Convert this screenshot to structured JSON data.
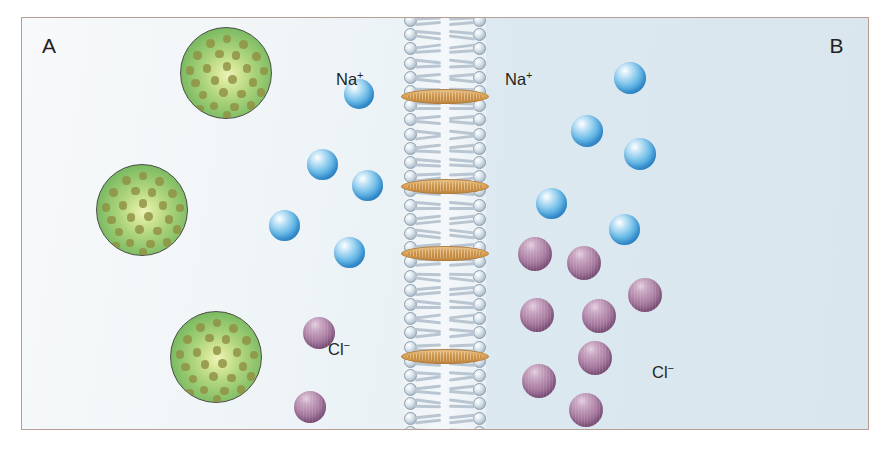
{
  "figure": {
    "compartment_a_label": "A",
    "compartment_b_label": "B",
    "background_left": "#f3f7f8",
    "background_right": "#dce8f0",
    "border_color": "#b79d94"
  },
  "labels": {
    "na_left": "Na",
    "na_left_charge": "+",
    "na_right": "Na",
    "na_right_charge": "+",
    "cl_left": "Cl",
    "cl_left_charge": "−",
    "cl_right": "Cl",
    "cl_right_charge": "−"
  },
  "legend": {
    "protein_color": "#7cbb63",
    "protein_dot_color": "#8f9042",
    "sodium_color": "#3d9ddc",
    "chloride_color": "#92638c",
    "channel_color": "#dca85e",
    "lipid_head_color": "#aebecd",
    "lipid_tail_color": "#b9c6d2"
  },
  "chart_data": {
    "type": "diagram",
    "compartments": [
      {
        "name": "A",
        "side": "left",
        "sodium_count": 5,
        "chloride_count": 2,
        "protein_count": 3
      },
      {
        "name": "B",
        "side": "right",
        "sodium_count": 5,
        "chloride_count": 9,
        "protein_count": 0
      }
    ],
    "membrane": {
      "type": "phospholipid-bilayer",
      "channel_protein_count": 4,
      "channel_positions_y": [
        88,
        178,
        245,
        348
      ]
    },
    "species": [
      {
        "name": "Na+",
        "color": "#3d9ddc",
        "total": 10
      },
      {
        "name": "Cl-",
        "color": "#92638c",
        "total": 11
      },
      {
        "name": "protein",
        "color": "#7cbb63",
        "total": 3
      }
    ]
  },
  "proteins": [
    {
      "x": 158,
      "y": 9,
      "d": 92
    },
    {
      "x": 74,
      "y": 146,
      "d": 92
    },
    {
      "x": 148,
      "y": 293,
      "d": 92
    }
  ],
  "protein_dots": [
    {
      "cx": 0.5,
      "cy": 0.12
    },
    {
      "cx": 0.32,
      "cy": 0.17
    },
    {
      "cx": 0.68,
      "cy": 0.18
    },
    {
      "cx": 0.18,
      "cy": 0.3
    },
    {
      "cx": 0.42,
      "cy": 0.28
    },
    {
      "cx": 0.6,
      "cy": 0.3
    },
    {
      "cx": 0.82,
      "cy": 0.31
    },
    {
      "cx": 0.1,
      "cy": 0.46
    },
    {
      "cx": 0.28,
      "cy": 0.44
    },
    {
      "cx": 0.5,
      "cy": 0.42
    },
    {
      "cx": 0.72,
      "cy": 0.44
    },
    {
      "cx": 0.9,
      "cy": 0.47
    },
    {
      "cx": 0.16,
      "cy": 0.6
    },
    {
      "cx": 0.37,
      "cy": 0.57
    },
    {
      "cx": 0.56,
      "cy": 0.56
    },
    {
      "cx": 0.78,
      "cy": 0.59
    },
    {
      "cx": 0.24,
      "cy": 0.73
    },
    {
      "cx": 0.46,
      "cy": 0.7
    },
    {
      "cx": 0.66,
      "cy": 0.72
    },
    {
      "cx": 0.87,
      "cy": 0.7
    },
    {
      "cx": 0.36,
      "cy": 0.85
    },
    {
      "cx": 0.58,
      "cy": 0.86
    },
    {
      "cx": 0.76,
      "cy": 0.84
    },
    {
      "cx": 0.5,
      "cy": 0.95
    },
    {
      "cx": 0.2,
      "cy": 0.88
    }
  ],
  "sodium_ions": [
    {
      "x": 322,
      "y": 61,
      "d": 30,
      "side": "A"
    },
    {
      "x": 285,
      "y": 131,
      "d": 31,
      "side": "A"
    },
    {
      "x": 330,
      "y": 152,
      "d": 31,
      "side": "A"
    },
    {
      "x": 247,
      "y": 192,
      "d": 31,
      "side": "A"
    },
    {
      "x": 312,
      "y": 219,
      "d": 31,
      "side": "A"
    },
    {
      "x": 592,
      "y": 44,
      "d": 32,
      "side": "B"
    },
    {
      "x": 549,
      "y": 97,
      "d": 32,
      "side": "B"
    },
    {
      "x": 602,
      "y": 120,
      "d": 32,
      "side": "B"
    },
    {
      "x": 514,
      "y": 170,
      "d": 31,
      "side": "B"
    },
    {
      "x": 587,
      "y": 196,
      "d": 31,
      "side": "B"
    }
  ],
  "chloride_ions": [
    {
      "x": 281,
      "y": 299,
      "d": 32,
      "side": "A"
    },
    {
      "x": 272,
      "y": 373,
      "d": 32,
      "side": "A"
    },
    {
      "x": 496,
      "y": 219,
      "d": 34,
      "side": "B"
    },
    {
      "x": 545,
      "y": 228,
      "d": 34,
      "side": "B"
    },
    {
      "x": 606,
      "y": 260,
      "d": 34,
      "side": "B"
    },
    {
      "x": 498,
      "y": 280,
      "d": 34,
      "side": "B"
    },
    {
      "x": 560,
      "y": 281,
      "d": 34,
      "side": "B"
    },
    {
      "x": 556,
      "y": 323,
      "d": 34,
      "side": "B"
    },
    {
      "x": 500,
      "y": 346,
      "d": 34,
      "side": "B"
    },
    {
      "x": 547,
      "y": 375,
      "d": 34,
      "side": "B"
    },
    {
      "x": 611,
      "y": 258,
      "d": 0,
      "side": "B"
    }
  ]
}
